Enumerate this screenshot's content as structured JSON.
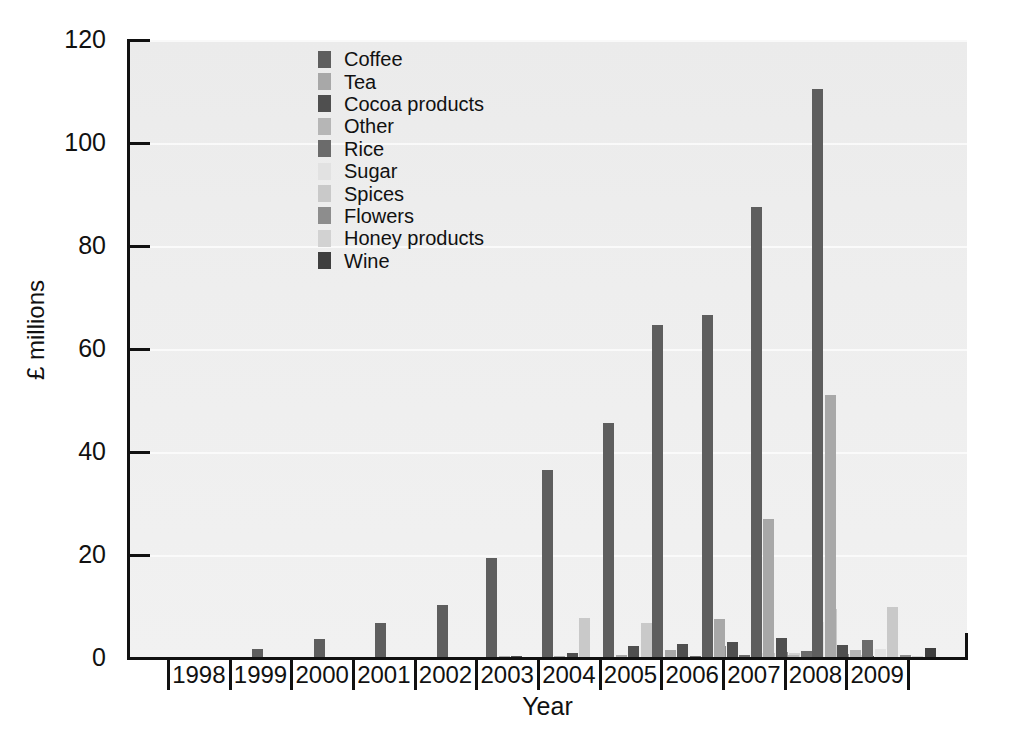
{
  "chart_data": {
    "type": "bar",
    "title": "",
    "xlabel": "Year",
    "ylabel": "£ millions",
    "ylim": [
      0,
      120
    ],
    "yticks": [
      0,
      20,
      40,
      60,
      80,
      100,
      120
    ],
    "grid": true,
    "legend_position": "top-center-inside",
    "categories": [
      "1998",
      "1999",
      "2000",
      "2001",
      "2002",
      "2003",
      "2004",
      "2005",
      "2006",
      "2007",
      "2008",
      "2009"
    ],
    "series": [
      {
        "name": "Coffee",
        "color": "#5e5e5e",
        "values": [
          0,
          1.7,
          3.6,
          6.8,
          10.3,
          19.4,
          36.6,
          45.6,
          64.6,
          66.7,
          87.6,
          110.5
        ]
      },
      {
        "name": "Tea",
        "color": "#a8a8a8",
        "values": [
          0,
          0,
          0,
          0,
          0,
          0.2,
          0.4,
          0.6,
          1.5,
          7.5,
          26.9,
          51.0
        ]
      },
      {
        "name": "Cocoa products",
        "color": "#4f4f4f",
        "values": [
          0,
          0,
          0,
          0,
          0,
          0.4,
          1.0,
          2.3,
          2.8,
          3.2,
          3.8,
          2.6
        ]
      },
      {
        "name": "Other",
        "color": "#b6b6b6",
        "values": [
          0,
          0,
          0,
          0,
          0,
          0,
          0,
          0,
          0,
          0,
          0.5,
          1.5
        ]
      },
      {
        "name": "Rice",
        "color": "#6b6b6b",
        "values": [
          0,
          0,
          0,
          0,
          0,
          0,
          0,
          0,
          0.4,
          0.6,
          1.3,
          3.5
        ]
      },
      {
        "name": "Sugar",
        "color": "#e2e2e2",
        "values": [
          0,
          0,
          0,
          0,
          0,
          0,
          0,
          0,
          0,
          0.9,
          7.0,
          1.7
        ]
      },
      {
        "name": "Spices",
        "color": "#c9c9c9",
        "values": [
          0,
          0,
          0,
          0,
          0,
          0,
          7.8,
          6.8,
          6.0,
          1.0,
          9.5,
          9.9
        ]
      },
      {
        "name": "Flowers",
        "color": "#8d8d8d",
        "values": [
          0,
          0,
          0,
          0,
          0,
          0,
          0,
          0,
          2.4,
          1.2,
          0.8,
          0.6
        ]
      },
      {
        "name": "Honey products",
        "color": "#d2d2d2",
        "values": [
          0,
          0,
          0,
          0,
          0,
          0,
          0,
          0,
          0,
          1.0,
          0.5,
          0.4
        ]
      },
      {
        "name": "Wine",
        "color": "#3f3f3f",
        "values": [
          0,
          0,
          0,
          0,
          0,
          0,
          0,
          0,
          0,
          0,
          0.4,
          1.9
        ]
      }
    ]
  },
  "axis": {
    "y_title": "£ millions",
    "x_title": "Year",
    "y_tick_labels": [
      "0",
      "20",
      "40",
      "60",
      "80",
      "100",
      "120"
    ],
    "x_tick_labels": [
      "1998",
      "1999",
      "2000",
      "2001",
      "2002",
      "2003",
      "2004",
      "2005",
      "2006",
      "2007",
      "2008",
      "2009"
    ]
  },
  "legend": {
    "items": [
      {
        "label": "Coffee",
        "color": "#5e5e5e"
      },
      {
        "label": "Tea",
        "color": "#a8a8a8"
      },
      {
        "label": "Cocoa products",
        "color": "#4f4f4f"
      },
      {
        "label": "Other",
        "color": "#b6b6b6"
      },
      {
        "label": "Rice",
        "color": "#6b6b6b"
      },
      {
        "label": "Sugar",
        "color": "#e2e2e2"
      },
      {
        "label": "Spices",
        "color": "#c9c9c9"
      },
      {
        "label": "Flowers",
        "color": "#8d8d8d"
      },
      {
        "label": "Honey products",
        "color": "#d2d2d2"
      },
      {
        "label": "Wine",
        "color": "#3f3f3f"
      }
    ]
  },
  "theme": {
    "plot_background": "#eeeeee",
    "page_background": "#ffffff",
    "axis_color": "#111111",
    "gridline_color": "#fbfbfb",
    "text_color": "#111111"
  }
}
